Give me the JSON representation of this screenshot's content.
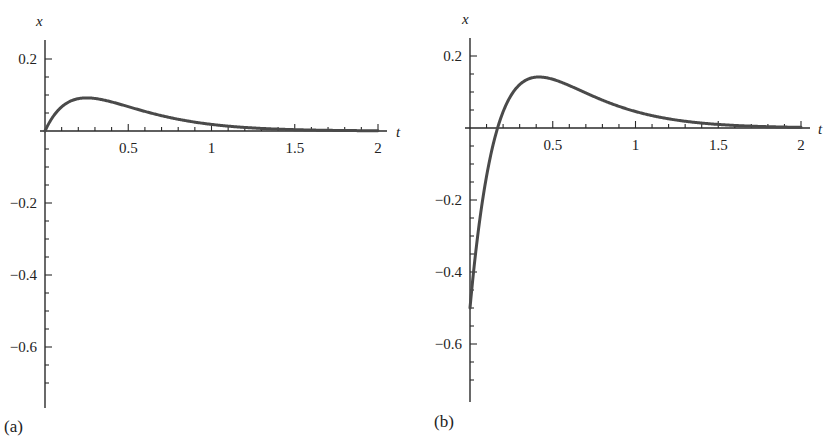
{
  "chart_data": [
    {
      "type": "line",
      "panel_label": "(a)",
      "title": "",
      "xlabel": "t",
      "ylabel": "x",
      "xlim": [
        0,
        2
      ],
      "ylim": [
        -0.75,
        0.25
      ],
      "x_ticks": [
        0.5,
        1,
        1.5,
        2
      ],
      "x_tick_labels": [
        "0.5",
        "1",
        "1.5",
        "2"
      ],
      "y_ticks": [
        0.2,
        -0.2,
        -0.4,
        -0.6
      ],
      "y_tick_labels": [
        "0.2",
        "−0.2",
        "−0.4",
        "−0.6"
      ],
      "grid": false,
      "legend": null,
      "series": [
        {
          "name": "x(t)",
          "x": [
            0,
            0.05,
            0.1,
            0.15,
            0.2,
            0.25,
            0.3,
            0.4,
            0.5,
            0.6,
            0.7,
            0.8,
            1.0,
            1.2,
            1.5,
            1.75,
            2.0
          ],
          "values": [
            0,
            0.041,
            0.067,
            0.082,
            0.09,
            0.092,
            0.09,
            0.081,
            0.068,
            0.054,
            0.043,
            0.033,
            0.018,
            0.01,
            0.004,
            0.002,
            0.001
          ]
        }
      ]
    },
    {
      "type": "line",
      "panel_label": "(b)",
      "title": "",
      "xlabel": "t",
      "ylabel": "x",
      "xlim": [
        0,
        2
      ],
      "ylim": [
        -0.75,
        0.25
      ],
      "x_ticks": [
        0.5,
        1,
        1.5,
        2
      ],
      "x_tick_labels": [
        "0.5",
        "1",
        "1.5",
        "2"
      ],
      "y_ticks": [
        0.2,
        -0.2,
        -0.4,
        -0.6
      ],
      "y_tick_labels": [
        "0.2",
        "−0.2",
        "−0.4",
        "−0.6"
      ],
      "grid": false,
      "legend": null,
      "series": [
        {
          "name": "x(t)",
          "x": [
            0,
            0.05,
            0.1,
            0.167,
            0.25,
            0.3,
            0.417,
            0.5,
            0.6,
            0.7,
            0.8,
            1.0,
            1.2,
            1.5,
            1.75,
            2.0
          ],
          "values": [
            -0.5,
            -0.286,
            -0.134,
            0,
            0.092,
            0.12,
            0.142,
            0.135,
            0.118,
            0.098,
            0.077,
            0.046,
            0.026,
            0.01,
            0.005,
            0.002
          ]
        }
      ]
    }
  ]
}
